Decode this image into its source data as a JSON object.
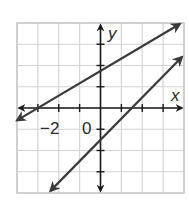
{
  "chart_data": {
    "type": "line",
    "title": "",
    "xlabel": "x",
    "ylabel": "y",
    "xlim": [
      -4,
      4
    ],
    "ylim": [
      -4,
      4
    ],
    "grid": true,
    "tick_step": 1,
    "tick_labels": {
      "x": [
        "-2"
      ],
      "origin": "0"
    },
    "series": [
      {
        "name": "line 1",
        "equation": "y ≈ 0.58x + 1.75",
        "x": [
          -4,
          -3,
          0,
          3.8
        ],
        "values": [
          -0.58,
          0,
          1.75,
          3.95
        ],
        "arrows": "both"
      },
      {
        "name": "line 2",
        "equation": "y = x - 1.5",
        "x": [
          -2.4,
          0,
          1.5,
          3.9
        ],
        "values": [
          -3.9,
          -1.5,
          0,
          2.4
        ],
        "arrows": "both"
      }
    ]
  },
  "labels": {
    "x_axis": "x",
    "y_axis": "y",
    "tick_neg2": "−2",
    "origin": "0"
  },
  "colors": {
    "grid": "#d4d4d4",
    "border": "#c8c8c8",
    "axis": "#1a1a1a",
    "line": "#3a3a3a"
  }
}
